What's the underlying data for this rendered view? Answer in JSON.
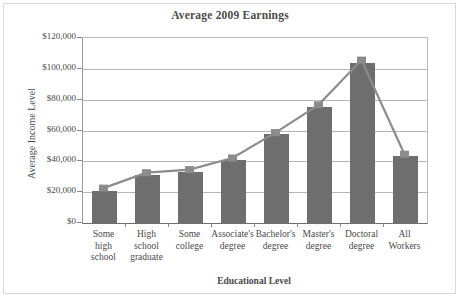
{
  "chart_data": {
    "type": "bar",
    "title": "Average 2009 Earnings",
    "xlabel": "Educational Level",
    "ylabel": "Average Income Level",
    "categories": [
      "Some high school",
      "High school graduate",
      "Some college",
      "Associate's degree",
      "Bachelor's degree",
      "Master's degree",
      "Doctoral degree",
      "All Workers"
    ],
    "category_lines": [
      [
        "Some",
        "high",
        "school"
      ],
      [
        "High",
        "school",
        "graduate"
      ],
      [
        "Some",
        "college"
      ],
      [
        "Associate's",
        "degree"
      ],
      [
        "Bachelor's",
        "degree"
      ],
      [
        "Master's",
        "degree"
      ],
      [
        "Doctoral",
        "degree"
      ],
      [
        "All",
        "Workers"
      ]
    ],
    "values": [
      21000,
      31000,
      33000,
      41000,
      57500,
      75000,
      103500,
      43500
    ],
    "series": [
      {
        "name": "Average Income Level",
        "type": "bar",
        "values": [
          21000,
          31000,
          33000,
          41000,
          57500,
          75000,
          103500,
          43500
        ]
      },
      {
        "name": "Trend",
        "type": "line",
        "values": [
          22000,
          32000,
          34000,
          41500,
          58000,
          76000,
          105000,
          44000
        ]
      }
    ],
    "ylim": [
      0,
      120000
    ],
    "ytick_values": [
      0,
      20000,
      40000,
      60000,
      80000,
      100000,
      120000
    ],
    "ytick_labels": [
      "$0",
      "$20,000",
      "$40,000",
      "$60,000",
      "$80,000",
      "$100,000",
      "$120,000"
    ],
    "grid": true,
    "legend": "none",
    "colors": {
      "bar": "#6e6e6e",
      "line": "#8c8c8c",
      "marker": "#8c8c8c",
      "grid": "#b6b6b6",
      "axis": "#6f6f6f",
      "text": "#4a4a4a",
      "background": "#ffffff"
    }
  }
}
